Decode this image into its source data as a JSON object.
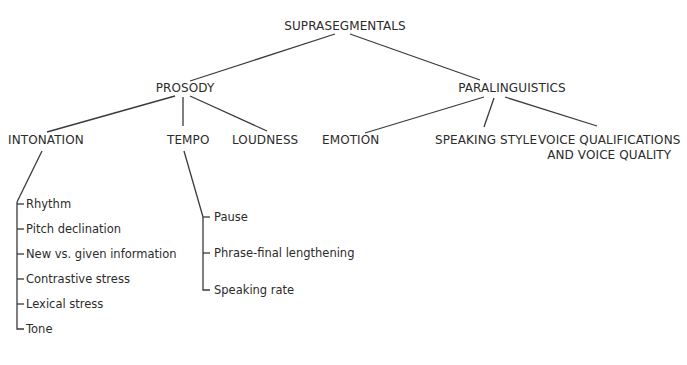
{
  "diagram": {
    "type": "tree",
    "root": {
      "label": "SUPRASEGMENTALS"
    },
    "level1": [
      {
        "label": "PROSODY"
      },
      {
        "label": "PARALINGUISTICS"
      }
    ],
    "prosody_children": [
      {
        "label": "INTONATION"
      },
      {
        "label": "TEMPO"
      },
      {
        "label": "LOUDNESS"
      }
    ],
    "paralinguistics_children": [
      {
        "label": "EMOTION"
      },
      {
        "label": "SPEAKING STYLE"
      },
      {
        "label_line1": "VOICE QUALIFICATIONS",
        "label_line2": "AND VOICE QUALITY"
      }
    ],
    "intonation_items": [
      "Rhythm",
      "Pitch declination",
      "New vs. given information",
      "Contrastive stress",
      "Lexical stress",
      "Tone"
    ],
    "tempo_items": [
      "Pause",
      "Phrase-final lengthening",
      "Speaking rate"
    ]
  }
}
